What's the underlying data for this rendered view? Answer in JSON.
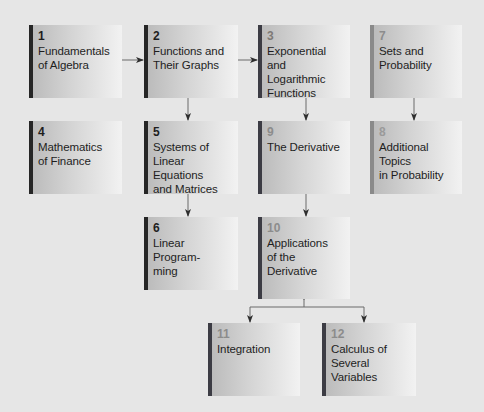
{
  "diagram": {
    "type": "chapter-dependency-flowchart",
    "colors": {
      "background": "#e6e6e6",
      "bar_dark": "#262626",
      "bar_slate": "#3c3c44",
      "bar_gray": "#8a8a8a",
      "num_dark": "#1e1e1e",
      "num_gray": "#8c8c8c",
      "arrow": "#333333"
    },
    "chapters": [
      {
        "number": "1",
        "title": "Fundamentals\nof Algebra"
      },
      {
        "number": "2",
        "title": "Functions and\nTheir Graphs"
      },
      {
        "number": "3",
        "title": "Exponential and\nLogarithmic\nFunctions"
      },
      {
        "number": "7",
        "title": "Sets and\nProbability"
      },
      {
        "number": "4",
        "title": "Mathematics\nof Finance"
      },
      {
        "number": "5",
        "title": "Systems of\nLinear Equations\nand Matrices"
      },
      {
        "number": "9",
        "title": "The Derivative"
      },
      {
        "number": "8",
        "title": "Additional Topics\nin Probability"
      },
      {
        "number": "6",
        "title": "Linear Program-\nming"
      },
      {
        "number": "10",
        "title": "Applications\nof the\nDerivative"
      },
      {
        "number": "11",
        "title": "Integration"
      },
      {
        "number": "12",
        "title": "Calculus of\nSeveral Variables"
      }
    ],
    "edges": [
      {
        "from": "1",
        "to": "2"
      },
      {
        "from": "2",
        "to": "3"
      },
      {
        "from": "2",
        "to": "5"
      },
      {
        "from": "3",
        "to": "9"
      },
      {
        "from": "7",
        "to": "8"
      },
      {
        "from": "5",
        "to": "6"
      },
      {
        "from": "9",
        "to": "10"
      },
      {
        "from": "10",
        "to": "11"
      },
      {
        "from": "10",
        "to": "12"
      }
    ]
  }
}
